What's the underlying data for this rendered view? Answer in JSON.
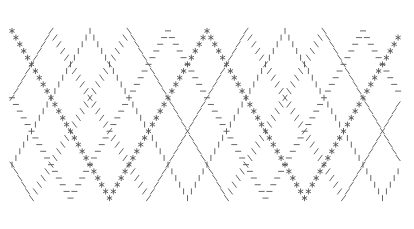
{
  "figure": {
    "background_color": "#ffffff",
    "width": 414,
    "height": 229,
    "axes_visible": false,
    "grid_visible": false,
    "title": "",
    "legend_visible": false
  },
  "chart_data": {
    "type": "scatter",
    "title": "",
    "subtitle": "",
    "xlabel": "",
    "ylabel": "",
    "xlim": [
      0,
      100
    ],
    "ylim": [
      -1.25,
      1.25
    ],
    "grid": false,
    "legend": false,
    "marker_color": "#555555",
    "x": [
      0,
      1,
      2,
      3,
      4,
      5,
      6,
      7,
      8,
      9,
      10,
      11,
      12,
      13,
      14,
      15,
      16,
      17,
      18,
      19,
      20,
      21,
      22,
      23,
      24,
      25,
      26,
      27,
      28,
      29,
      30,
      31,
      32,
      33,
      34,
      35,
      36,
      37,
      38,
      39,
      40,
      41,
      42,
      43,
      44,
      45,
      46,
      47,
      48,
      49,
      50,
      51,
      52,
      53,
      54,
      55,
      56,
      57,
      58,
      59,
      60,
      61,
      62,
      63,
      64,
      65,
      66,
      67,
      68,
      69,
      70,
      71,
      72,
      73,
      74,
      75,
      76,
      77,
      78,
      79,
      80,
      81,
      82,
      83,
      84,
      85,
      86,
      87,
      88,
      89,
      90,
      91,
      92,
      93,
      94,
      95,
      96,
      97,
      98,
      99
    ],
    "series": [
      {
        "name": "series-star",
        "marker": "*",
        "marker_name": "star-marker",
        "color": "#555555",
        "phase_deg": 0,
        "period": 50,
        "waveform": "triangle",
        "values": [
          1.0,
          0.92,
          0.84,
          0.76,
          0.68,
          0.6,
          0.52,
          0.44,
          0.36,
          0.28,
          0.2,
          0.12,
          0.04,
          -0.04,
          -0.12,
          -0.2,
          -0.28,
          -0.36,
          -0.44,
          -0.52,
          -0.6,
          -0.68,
          -0.76,
          -0.84,
          -0.92,
          -1.0,
          -0.92,
          -0.84,
          -0.76,
          -0.68,
          -0.6,
          -0.52,
          -0.44,
          -0.36,
          -0.28,
          -0.2,
          -0.12,
          -0.04,
          0.04,
          0.12,
          0.2,
          0.28,
          0.36,
          0.44,
          0.52,
          0.6,
          0.68,
          0.76,
          0.84,
          0.92,
          1.0,
          0.92,
          0.84,
          0.76,
          0.68,
          0.6,
          0.52,
          0.44,
          0.36,
          0.28,
          0.2,
          0.12,
          0.04,
          -0.04,
          -0.12,
          -0.2,
          -0.28,
          -0.36,
          -0.44,
          -0.52,
          -0.6,
          -0.68,
          -0.76,
          -0.84,
          -0.92,
          -1.0,
          -0.92,
          -0.84,
          -0.76,
          -0.68,
          -0.6,
          -0.52,
          -0.44,
          -0.36,
          -0.28,
          -0.2,
          -0.12,
          -0.04,
          0.04,
          0.12,
          0.2,
          0.28,
          0.36,
          0.44,
          0.52,
          0.6,
          0.68,
          0.76,
          0.84,
          0.92
        ]
      },
      {
        "name": "series-hline",
        "marker": "_",
        "marker_name": "hline-marker",
        "color": "#555555",
        "phase_deg": 72,
        "period": 50,
        "waveform": "triangle",
        "values": [
          0.2,
          0.12,
          0.04,
          -0.04,
          -0.12,
          -0.2,
          -0.28,
          -0.36,
          -0.44,
          -0.52,
          -0.6,
          -0.68,
          -0.76,
          -0.84,
          -0.92,
          -1.0,
          -0.92,
          -0.84,
          -0.76,
          -0.68,
          -0.6,
          -0.52,
          -0.44,
          -0.36,
          -0.28,
          -0.2,
          -0.12,
          -0.04,
          0.04,
          0.12,
          0.2,
          0.28,
          0.36,
          0.44,
          0.52,
          0.6,
          0.68,
          0.76,
          0.84,
          0.92,
          1.0,
          0.92,
          0.84,
          0.76,
          0.68,
          0.6,
          0.52,
          0.44,
          0.36,
          0.28,
          0.2,
          0.12,
          0.04,
          -0.04,
          -0.12,
          -0.2,
          -0.28,
          -0.36,
          -0.44,
          -0.52,
          -0.6,
          -0.68,
          -0.76,
          -0.84,
          -0.92,
          -1.0,
          -0.92,
          -0.84,
          -0.76,
          -0.68,
          -0.6,
          -0.52,
          -0.44,
          -0.36,
          -0.28,
          -0.2,
          -0.12,
          -0.04,
          0.04,
          0.12,
          0.2,
          0.28,
          0.36,
          0.44,
          0.52,
          0.6,
          0.68,
          0.76,
          0.84,
          0.92,
          1.0,
          0.92,
          0.84,
          0.76,
          0.68,
          0.6,
          0.52,
          0.44,
          0.36,
          0.28
        ]
      },
      {
        "name": "series-backslash",
        "marker": "\\",
        "marker_name": "backslash-marker",
        "color": "#555555",
        "phase_deg": 144,
        "period": 50,
        "waveform": "triangle",
        "values": [
          -0.6,
          -0.68,
          -0.76,
          -0.84,
          -0.92,
          -1.0,
          -0.92,
          -0.84,
          -0.76,
          -0.68,
          -0.6,
          -0.52,
          -0.44,
          -0.36,
          -0.28,
          -0.2,
          -0.12,
          -0.04,
          0.04,
          0.12,
          0.2,
          0.28,
          0.36,
          0.44,
          0.52,
          0.6,
          0.68,
          0.76,
          0.84,
          0.92,
          1.0,
          0.92,
          0.84,
          0.76,
          0.68,
          0.6,
          0.52,
          0.44,
          0.36,
          0.28,
          0.2,
          0.12,
          0.04,
          -0.04,
          -0.12,
          -0.2,
          -0.28,
          -0.36,
          -0.44,
          -0.52,
          -0.6,
          -0.68,
          -0.76,
          -0.84,
          -0.92,
          -1.0,
          -0.92,
          -0.84,
          -0.76,
          -0.68,
          -0.6,
          -0.52,
          -0.44,
          -0.36,
          -0.28,
          -0.2,
          -0.12,
          -0.04,
          0.04,
          0.12,
          0.2,
          0.28,
          0.36,
          0.44,
          0.52,
          0.6,
          0.68,
          0.76,
          0.84,
          0.92,
          1.0,
          0.92,
          0.84,
          0.76,
          0.68,
          0.6,
          0.52,
          0.44,
          0.36,
          0.28,
          0.2,
          0.12,
          0.04,
          -0.04,
          -0.12,
          -0.2,
          -0.28,
          -0.36,
          -0.44,
          -0.52
        ]
      },
      {
        "name": "series-vline",
        "marker": "|",
        "marker_name": "vline-marker",
        "color": "#555555",
        "phase_deg": 216,
        "period": 50,
        "waveform": "triangle",
        "values": [
          -0.6,
          -0.52,
          -0.44,
          -0.36,
          -0.28,
          -0.2,
          -0.12,
          -0.04,
          0.04,
          0.12,
          0.2,
          0.28,
          0.36,
          0.44,
          0.52,
          0.6,
          0.68,
          0.76,
          0.84,
          0.92,
          1.0,
          0.92,
          0.84,
          0.76,
          0.68,
          0.6,
          0.52,
          0.44,
          0.36,
          0.28,
          0.2,
          0.12,
          0.04,
          -0.04,
          -0.12,
          -0.2,
          -0.28,
          -0.36,
          -0.44,
          -0.52,
          -0.6,
          -0.68,
          -0.76,
          -0.84,
          -0.92,
          -1.0,
          -0.92,
          -0.84,
          -0.76,
          -0.68,
          -0.6,
          -0.52,
          -0.44,
          -0.36,
          -0.28,
          -0.2,
          -0.12,
          -0.04,
          0.04,
          0.12,
          0.2,
          0.28,
          0.36,
          0.44,
          0.52,
          0.6,
          0.68,
          0.76,
          0.84,
          0.92,
          1.0,
          0.92,
          0.84,
          0.76,
          0.68,
          0.6,
          0.52,
          0.44,
          0.36,
          0.28,
          0.2,
          0.12,
          0.04,
          -0.04,
          -0.12,
          -0.2,
          -0.28,
          -0.36,
          -0.44,
          -0.52,
          -0.6,
          -0.68,
          -0.76,
          -0.84,
          -0.92,
          -1.0,
          -0.92,
          -0.84,
          -0.76,
          -0.68
        ]
      },
      {
        "name": "series-slash",
        "marker": "/",
        "marker_name": "slash-marker",
        "color": "#555555",
        "phase_deg": 288,
        "period": 50,
        "waveform": "triangle",
        "values": [
          0.2,
          0.28,
          0.36,
          0.44,
          0.52,
          0.6,
          0.68,
          0.76,
          0.84,
          0.92,
          1.0,
          0.92,
          0.84,
          0.76,
          0.68,
          0.6,
          0.52,
          0.44,
          0.36,
          0.28,
          0.2,
          0.12,
          0.04,
          -0.04,
          -0.12,
          -0.2,
          -0.28,
          -0.36,
          -0.44,
          -0.52,
          -0.6,
          -0.68,
          -0.76,
          -0.84,
          -0.92,
          -1.0,
          -0.92,
          -0.84,
          -0.76,
          -0.68,
          -0.6,
          -0.52,
          -0.44,
          -0.36,
          -0.28,
          -0.2,
          -0.12,
          -0.04,
          0.04,
          0.12,
          0.2,
          0.28,
          0.36,
          0.44,
          0.52,
          0.6,
          0.68,
          0.76,
          0.84,
          0.92,
          1.0,
          0.92,
          0.84,
          0.76,
          0.68,
          0.6,
          0.52,
          0.44,
          0.36,
          0.28,
          0.2,
          0.12,
          0.04,
          -0.04,
          -0.12,
          -0.2,
          -0.28,
          -0.36,
          -0.44,
          -0.52,
          -0.6,
          -0.68,
          -0.76,
          -0.84,
          -0.92,
          -1.0,
          -0.92,
          -0.84,
          -0.76,
          -0.68,
          -0.6,
          -0.52,
          -0.44,
          -0.36,
          -0.28,
          -0.2,
          -0.12,
          -0.04,
          0.04,
          0.12
        ]
      }
    ]
  }
}
